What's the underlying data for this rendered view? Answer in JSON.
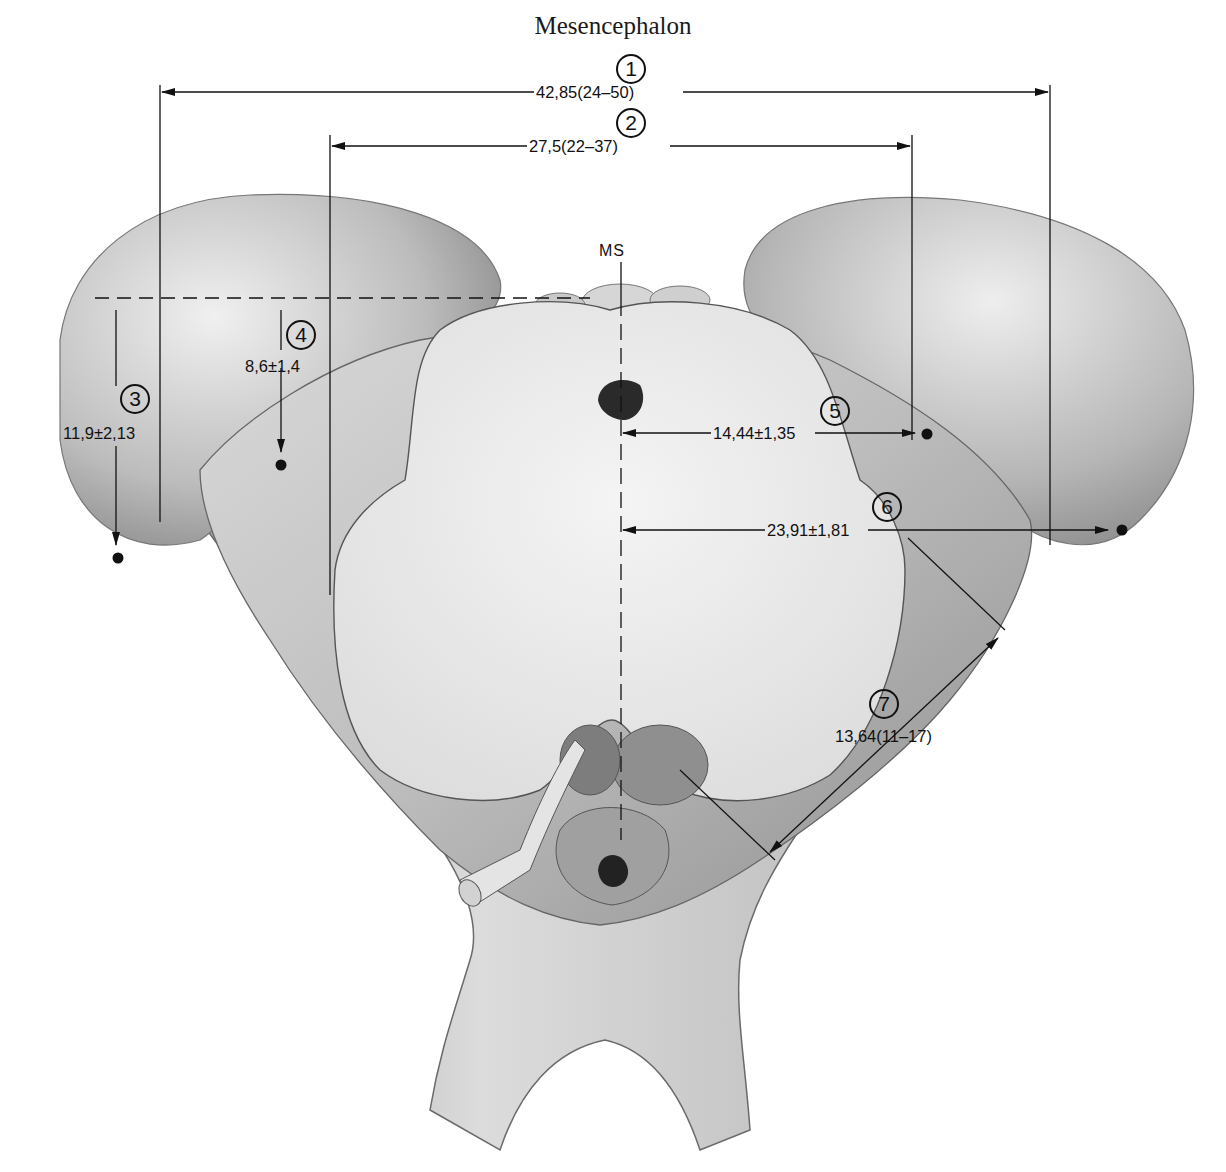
{
  "title": "Mesencephalon",
  "midline_label": "MS",
  "measurements": [
    {
      "id": "1",
      "value": "42,85(24–50)"
    },
    {
      "id": "2",
      "value": "27,5(22–37)"
    },
    {
      "id": "3",
      "value": "11,9±2,13"
    },
    {
      "id": "4",
      "value": "8,6±1,4"
    },
    {
      "id": "5",
      "value": "14,44±1,35"
    },
    {
      "id": "6",
      "value": "23,91±1,81"
    },
    {
      "id": "7",
      "value": "13,64(11–17)"
    }
  ],
  "colors": {
    "line": "#111111",
    "tissue_light": "#e8e8e8",
    "tissue_mid": "#b8b8b8",
    "tissue_dark": "#7a7a7a",
    "background": "#ffffff"
  }
}
